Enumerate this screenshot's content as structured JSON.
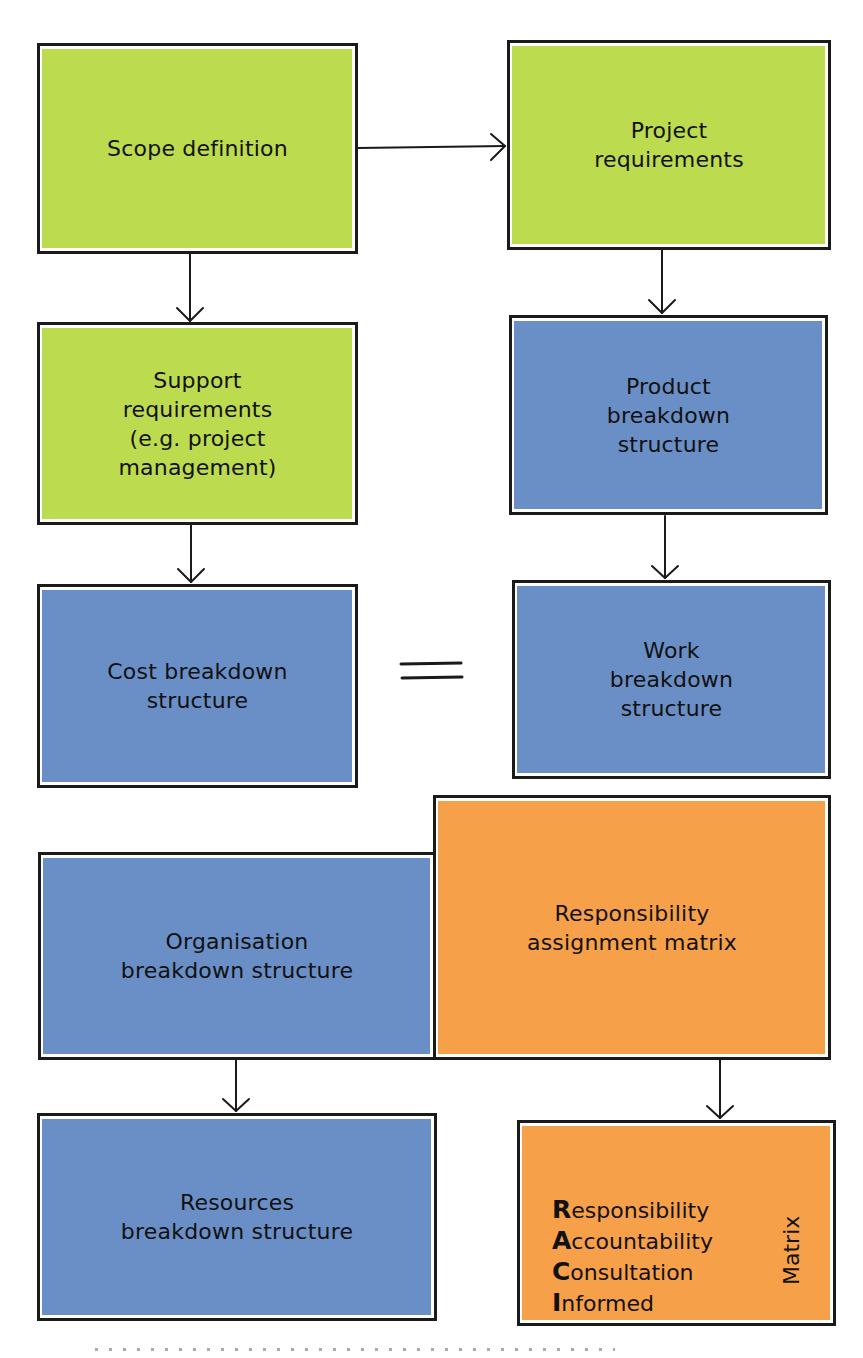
{
  "diagram": {
    "type": "flowchart",
    "colors": {
      "scope_green": "#bddb4f",
      "structure_blue": "#6a8fc6",
      "matrix_orange": "#f7a04a",
      "line": "#1a1a1a"
    },
    "nodes": {
      "scope_definition": {
        "label": "Scope definition",
        "color": "green"
      },
      "project_requirements": {
        "label": "Project\nrequirements",
        "color": "green"
      },
      "support_requirements": {
        "label": "Support\nrequirements\n(e.g. project\nmanagement)",
        "color": "green"
      },
      "product_breakdown": {
        "label": "Product\nbreakdown\nstructure",
        "color": "blue"
      },
      "cost_breakdown": {
        "label": "Cost breakdown\nstructure",
        "color": "blue"
      },
      "work_breakdown": {
        "label": "Work\nbreakdown\nstructure",
        "color": "blue"
      },
      "organisation_breakdown": {
        "label": "Organisation\nbreakdown structure",
        "color": "blue"
      },
      "responsibility_matrix": {
        "label": "Responsibility\nassignment matrix",
        "color": "orange"
      },
      "resources_breakdown": {
        "label": "Resources\nbreakdown structure",
        "color": "blue"
      },
      "raci": {
        "color": "orange",
        "rows": [
          {
            "initial": "R",
            "rest": "esponsibility"
          },
          {
            "initial": "A",
            "rest": "ccountability"
          },
          {
            "initial": "C",
            "rest": "onsultation"
          },
          {
            "initial": "I",
            "rest": "nformed"
          }
        ],
        "side_label": "Matrix"
      }
    },
    "edges": [
      {
        "from": "scope_definition",
        "to": "project_requirements",
        "type": "arrow"
      },
      {
        "from": "scope_definition",
        "to": "support_requirements",
        "type": "arrow"
      },
      {
        "from": "project_requirements",
        "to": "product_breakdown",
        "type": "arrow"
      },
      {
        "from": "support_requirements",
        "to": "cost_breakdown",
        "type": "arrow"
      },
      {
        "from": "product_breakdown",
        "to": "work_breakdown",
        "type": "arrow"
      },
      {
        "from": "cost_breakdown",
        "to": "work_breakdown",
        "type": "equals",
        "symbol": "="
      },
      {
        "from": "organisation_breakdown",
        "to": "resources_breakdown",
        "type": "arrow"
      },
      {
        "from": "responsibility_matrix",
        "to": "raci",
        "type": "arrow"
      }
    ]
  }
}
